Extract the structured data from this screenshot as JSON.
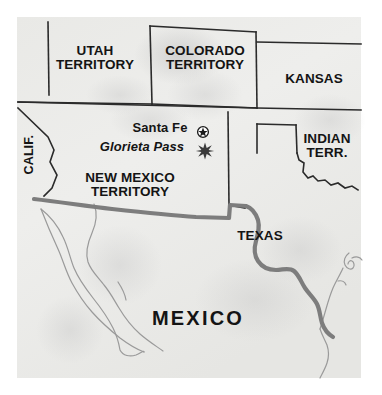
{
  "map": {
    "title": "Southwestern United States and Mexico, Civil War era",
    "background_color": "#ffffff",
    "land_color": "#ededeb",
    "border_color": "#262626",
    "river_color": "#8a8a8a",
    "text_color": "#141414",
    "regions": [
      {
        "id": "utah",
        "label": "UTAH\nTERRITORY",
        "x": 95,
        "y": 62,
        "type": "territory"
      },
      {
        "id": "colorado",
        "label": "COLORADO\nTERRITORY",
        "x": 205,
        "y": 62,
        "type": "territory"
      },
      {
        "id": "kansas",
        "label": "KANSAS",
        "x": 314,
        "y": 79,
        "type": "state"
      },
      {
        "id": "indian",
        "label": "INDIAN\nTERR.",
        "x": 327,
        "y": 147,
        "type": "territory"
      },
      {
        "id": "newmexico",
        "label": "NEW MEXICO\nTERRITORY",
        "x": 130,
        "y": 186,
        "type": "territory"
      },
      {
        "id": "texas",
        "label": "TEXAS",
        "x": 260,
        "y": 236,
        "type": "state"
      },
      {
        "id": "california",
        "label": "CALIF.",
        "x": 30,
        "y": 155,
        "type": "state-rotated"
      },
      {
        "id": "mexico",
        "label": "MEXICO",
        "x": 198,
        "y": 320,
        "type": "country"
      }
    ],
    "places": [
      {
        "id": "santa-fe",
        "label": "Santa Fe",
        "marker": "capital-star-circle",
        "label_x": 160,
        "label_y": 128,
        "marker_x": 203,
        "marker_y": 132
      },
      {
        "id": "glorieta-pass",
        "label": "Glorieta Pass",
        "marker": "battle-star",
        "label_x": 147,
        "label_y": 150,
        "marker_x": 205,
        "marker_y": 150
      }
    ]
  }
}
